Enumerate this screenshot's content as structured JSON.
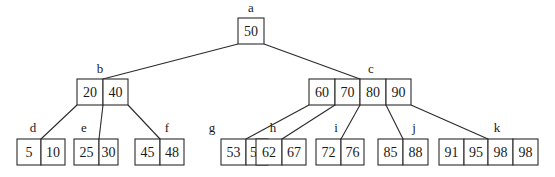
{
  "diagram": {
    "type": "B-tree",
    "cell_height": 26,
    "nodes": [
      {
        "id": "a",
        "label": "a",
        "keys": [
          "50"
        ],
        "x": 238,
        "y": 18,
        "cell_widths": [
          26
        ],
        "label_pos": [
          251,
          12
        ]
      },
      {
        "id": "b",
        "label": "b",
        "keys": [
          "20",
          "40"
        ],
        "x": 77,
        "y": 79,
        "cell_widths": [
          26,
          25
        ],
        "label_pos": [
          100,
          73
        ]
      },
      {
        "id": "c",
        "label": "c",
        "keys": [
          "60",
          "70",
          "80",
          "90"
        ],
        "x": 309,
        "y": 79,
        "cell_widths": [
          26,
          25,
          26,
          25
        ],
        "label_pos": [
          371,
          73
        ]
      },
      {
        "id": "d",
        "label": "d",
        "keys": [
          "5",
          "10"
        ],
        "x": 17,
        "y": 139,
        "cell_widths": [
          24,
          24
        ],
        "label_pos": [
          33,
          132
        ]
      },
      {
        "id": "e",
        "label": "e",
        "keys": [
          "25",
          "30"
        ],
        "x": 74,
        "y": 139,
        "cell_widths": [
          25,
          19
        ],
        "label_pos": [
          84,
          132
        ]
      },
      {
        "id": "f",
        "label": "f",
        "keys": [
          "45",
          "48"
        ],
        "x": 135,
        "y": 139,
        "cell_widths": [
          25,
          24
        ],
        "label_pos": [
          167,
          132
        ]
      },
      {
        "id": "g",
        "label": "g",
        "keys": [
          "53",
          "54"
        ],
        "x": 221,
        "y": 139,
        "cell_widths": [
          25,
          22
        ],
        "label_pos": [
          212,
          132
        ]
      },
      {
        "id": "h",
        "label": "h",
        "keys": [
          "62",
          "67"
        ],
        "x": 256,
        "y": 139,
        "cell_widths": [
          26,
          24
        ],
        "label_pos": [
          273,
          132
        ]
      },
      {
        "id": "i",
        "label": "i",
        "keys": [
          "72",
          "76"
        ],
        "x": 316,
        "y": 139,
        "cell_widths": [
          25,
          23
        ],
        "label_pos": [
          336,
          132
        ]
      },
      {
        "id": "j",
        "label": "j",
        "keys": [
          "85",
          "88"
        ],
        "x": 378,
        "y": 139,
        "cell_widths": [
          25,
          25
        ],
        "label_pos": [
          414,
          132
        ]
      },
      {
        "id": "k",
        "label": "k",
        "keys": [
          "91",
          "95",
          "98",
          "98"
        ],
        "x": 439,
        "y": 139,
        "cell_widths": [
          25,
          24,
          25,
          25
        ],
        "label_pos": [
          497,
          132
        ]
      }
    ],
    "edges": [
      {
        "from": "a",
        "to": "b",
        "x1": 238,
        "y1": 44,
        "x2": 103,
        "y2": 79
      },
      {
        "from": "a",
        "to": "c",
        "x1": 264,
        "y1": 44,
        "x2": 360,
        "y2": 79
      },
      {
        "from": "b",
        "to": "d",
        "x1": 77,
        "y1": 105,
        "x2": 41,
        "y2": 139
      },
      {
        "from": "b",
        "to": "e",
        "x1": 103,
        "y1": 105,
        "x2": 99,
        "y2": 139
      },
      {
        "from": "b",
        "to": "f",
        "x1": 128,
        "y1": 105,
        "x2": 160,
        "y2": 139
      },
      {
        "from": "c",
        "to": "g",
        "x1": 309,
        "y1": 105,
        "x2": 246,
        "y2": 139
      },
      {
        "from": "c",
        "to": "h",
        "x1": 335,
        "y1": 105,
        "x2": 282,
        "y2": 139
      },
      {
        "from": "c",
        "to": "i",
        "x1": 360,
        "y1": 105,
        "x2": 341,
        "y2": 139
      },
      {
        "from": "c",
        "to": "j",
        "x1": 386,
        "y1": 105,
        "x2": 403,
        "y2": 139
      },
      {
        "from": "c",
        "to": "k",
        "x1": 411,
        "y1": 105,
        "x2": 488,
        "y2": 139
      }
    ]
  }
}
